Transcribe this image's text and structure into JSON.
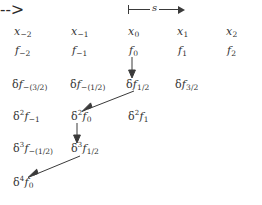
{
  "figure": {
    "type": "finite-difference-table",
    "spacing_label": {
      "symbol": "s",
      "description": "interval-spacing measure arrow spanning x0 to x1"
    },
    "rows": [
      {
        "id": "row-x",
        "order": "abscissae",
        "cells": [
          {
            "base": "x",
            "sub": "−2",
            "text": "x−2"
          },
          {
            "base": "x",
            "sub": "−1",
            "text": "x−1"
          },
          {
            "base": "x",
            "sub": "0",
            "text": "x0"
          },
          {
            "base": "x",
            "sub": "1",
            "text": "x1"
          },
          {
            "base": "x",
            "sub": "2",
            "text": "x2"
          }
        ]
      },
      {
        "id": "row-f",
        "order": "function-values",
        "cells": [
          {
            "base": "f",
            "sub": "−2",
            "text": "f−2"
          },
          {
            "base": "f",
            "sub": "−1",
            "text": "f−1"
          },
          {
            "base": "f",
            "sub": "0",
            "text": "f0"
          },
          {
            "base": "f",
            "sub": "1",
            "text": "f1"
          },
          {
            "base": "f",
            "sub": "2",
            "text": "f2"
          }
        ]
      },
      {
        "id": "row-d1",
        "order": "first-differences",
        "cells": [
          {
            "op": "δ",
            "pow": "",
            "base": "f",
            "sub": "−(3/2)",
            "text": "δf−(3/2)"
          },
          {
            "op": "δ",
            "pow": "",
            "base": "f",
            "sub": "−(1/2)",
            "text": "δf−(1/2)"
          },
          {
            "op": "δ",
            "pow": "",
            "base": "f",
            "sub": "1/2",
            "text": "δf1/2"
          },
          {
            "op": "δ",
            "pow": "",
            "base": "f",
            "sub": "3/2",
            "text": "δf3/2"
          }
        ]
      },
      {
        "id": "row-d2",
        "order": "second-differences",
        "cells": [
          {
            "op": "δ",
            "pow": "2",
            "base": "f",
            "sub": "−1",
            "text": "δ²f−1"
          },
          {
            "op": "δ",
            "pow": "2",
            "base": "f",
            "sub": "0",
            "text": "δ²f0"
          },
          {
            "op": "δ",
            "pow": "2",
            "base": "f",
            "sub": "1",
            "text": "δ²f1"
          }
        ]
      },
      {
        "id": "row-d3",
        "order": "third-differences",
        "cells": [
          {
            "op": "δ",
            "pow": "3",
            "base": "f",
            "sub": "−(1/2)",
            "text": "δ³f−(1/2)"
          },
          {
            "op": "δ",
            "pow": "3",
            "base": "f",
            "sub": "1/2",
            "text": "δ³f1/2"
          }
        ]
      },
      {
        "id": "row-d4",
        "order": "fourth-differences",
        "cells": [
          {
            "op": "δ",
            "pow": "4",
            "base": "f",
            "sub": "0",
            "text": "δ⁴f0"
          }
        ]
      }
    ],
    "arrows": [
      {
        "id": "arrow-f0-to-df12",
        "from": "f0",
        "to": "δf1/2",
        "direction": "down"
      },
      {
        "id": "arrow-df12-to-d2f0",
        "from": "δf1/2",
        "to": "δ²f0",
        "direction": "down-left"
      },
      {
        "id": "arrow-d2f0-to-d3f12",
        "from": "δ²f0",
        "to": "δ³f1/2",
        "direction": "down"
      },
      {
        "id": "arrow-d3f12-to-d4f0",
        "from": "δ³f1/2",
        "to": "δ⁴f0",
        "direction": "down-left"
      }
    ],
    "colors": {
      "ink": "#333333",
      "rule": "#3a3a3a",
      "background": "#ffffff"
    }
  }
}
